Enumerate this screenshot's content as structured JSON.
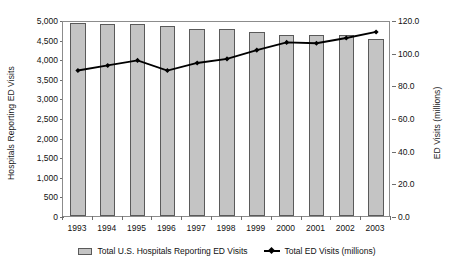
{
  "chart_data": {
    "type": "bar",
    "title": "",
    "subtitle": "",
    "xlabel": "",
    "ylabel": "Hospitals Reporting ED Visits",
    "y2label": "ED Visits (millions)",
    "categories": [
      "1993",
      "1994",
      "1995",
      "1996",
      "1997",
      "1998",
      "1999",
      "2000",
      "2001",
      "2002",
      "2003"
    ],
    "ylim": [
      0,
      5000
    ],
    "y2lim": [
      0,
      120
    ],
    "yticks": [
      "0",
      "500",
      "1,000",
      "1,500",
      "2,000",
      "2,500",
      "3,000",
      "3,500",
      "4,000",
      "4,500",
      "5,000"
    ],
    "ytick_values": [
      0,
      500,
      1000,
      1500,
      2000,
      2500,
      3000,
      3500,
      4000,
      4500,
      5000
    ],
    "y2ticks": [
      "0.0",
      "20.0",
      "40.0",
      "60.0",
      "80.0",
      "100.0",
      "120.0"
    ],
    "y2tick_values": [
      0,
      20,
      40,
      60,
      80,
      100,
      120
    ],
    "grid": false,
    "legend_position": "bottom",
    "series": [
      {
        "name": "Total U.S. Hospitals Reporting ED Visits",
        "type": "bar",
        "axis": "left",
        "color": "#c4c4c4",
        "edge_color": "#5a5a5a",
        "values": [
          4920,
          4900,
          4890,
          4840,
          4780,
          4760,
          4690,
          4620,
          4610,
          4610,
          4520
        ]
      },
      {
        "name": "Total ED Visits (millions)",
        "type": "line",
        "axis": "right",
        "color": "#000000",
        "marker": "diamond",
        "values": [
          90.3,
          93.4,
          96.5,
          90.3,
          94.9,
          97.4,
          102.8,
          107.5,
          107.0,
          110.2,
          113.9
        ]
      }
    ]
  },
  "legend": {
    "bar_label": "Total U.S. Hospitals Reporting ED Visits",
    "line_label": "Total ED Visits (millions)"
  }
}
